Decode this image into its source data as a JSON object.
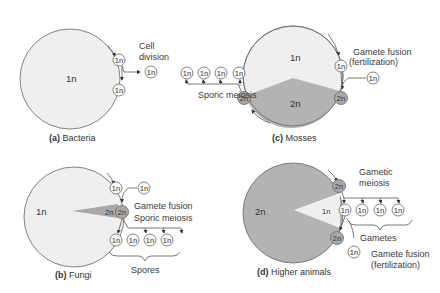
{
  "colors": {
    "haploid_fill": "#efefef",
    "diploid_fill": "#b3b3b3",
    "line": "#555555",
    "background": "#ffffff"
  },
  "panels": {
    "a": {
      "caption_letter": "(a)",
      "caption_text": "Bacteria",
      "main_label": "1n",
      "cells": [
        "1n",
        "1n",
        "1n"
      ],
      "labels": {
        "division_line1": "Cell",
        "division_line2": "division"
      }
    },
    "b": {
      "caption_letter": "(b)",
      "caption_text": "Fungi",
      "main_label": "1n",
      "wedge_label": "2n",
      "cells": [
        "1n",
        "1n",
        "2n",
        "1n",
        "1n",
        "1n",
        "1n"
      ],
      "labels": {
        "fusion": "Gamete fusion",
        "meiosis": "Sporic meiosis",
        "spores": "Spores"
      }
    },
    "c": {
      "caption_letter": "(c)",
      "caption_text": "Mosses",
      "upper_label": "1n",
      "lower_label": "2n",
      "cells": [
        "1n",
        "1n",
        "1n",
        "1n",
        "2n",
        "1n",
        "1n",
        "2n"
      ],
      "labels": {
        "meiosis": "Sporic meiosis",
        "fusion_line1": "Gamete fusion",
        "fusion_line2": "(fertilization)"
      }
    },
    "d": {
      "caption_letter": "(d)",
      "caption_text": "Higher animals",
      "main_label": "2n",
      "wedge_label": "1n",
      "cells": [
        "2n",
        "1n",
        "1n",
        "1n",
        "1n",
        "2n",
        "1n"
      ],
      "labels": {
        "meiosis_line1": "Gametic",
        "meiosis_line2": "meiosis",
        "gametes": "Gametes",
        "fusion_line1": "Gamete fusion",
        "fusion_line2": "(fertilization)"
      }
    }
  }
}
